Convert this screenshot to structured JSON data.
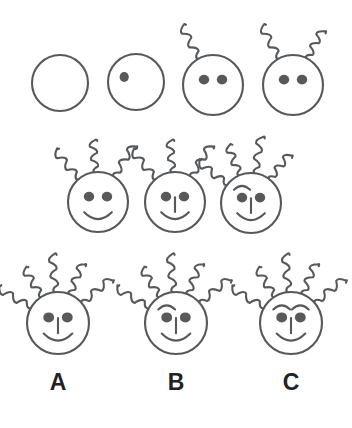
{
  "puzzle": {
    "type": "visual-analogy-matrix",
    "stroke_color": "#55595c",
    "eye_fill_color": "#595959",
    "label_color": "#222222",
    "background_color": "#ffffff",
    "stroke_width": 2.1,
    "sequence_rows": [
      {
        "row_name": "sequence-row-1",
        "figures": [
          {
            "name": "figure-1",
            "cx": 60,
            "cy": 83,
            "r": 28,
            "eyes": 0,
            "antennae": 0,
            "eyebrows": 0,
            "nose": false,
            "mouth": false
          },
          {
            "name": "figure-2",
            "cx": 136,
            "cy": 82,
            "r": 28,
            "eyes": 1,
            "antennae": 0,
            "eyebrows": 0,
            "nose": false,
            "mouth": false
          },
          {
            "name": "figure-3",
            "cx": 213,
            "cy": 85,
            "r": 30,
            "eyes": 2,
            "antennae": 1,
            "eyebrows": 0,
            "nose": false,
            "mouth": false
          },
          {
            "name": "figure-4",
            "cx": 293,
            "cy": 85,
            "r": 30,
            "eyes": 2,
            "antennae": 2,
            "eyebrows": 0,
            "nose": false,
            "mouth": false
          }
        ]
      },
      {
        "row_name": "sequence-row-2",
        "figures": [
          {
            "name": "figure-5",
            "cx": 98,
            "cy": 202,
            "r": 30,
            "eyes": 2,
            "antennae": 3,
            "eyebrows": 0,
            "nose": false,
            "mouth": true
          },
          {
            "name": "figure-6",
            "cx": 175,
            "cy": 202,
            "r": 30,
            "eyes": 2,
            "antennae": 3,
            "eyebrows": 0,
            "nose": true,
            "mouth": true
          },
          {
            "name": "figure-7",
            "cx": 251,
            "cy": 203,
            "r": 30,
            "eyes": 2,
            "antennae": 4,
            "eyebrows": 1,
            "nose": true,
            "mouth": true
          }
        ]
      }
    ],
    "answer_row": {
      "row_name": "answer-options-row",
      "options": [
        {
          "name": "option-a",
          "label": "A",
          "cx": 58,
          "cy": 323,
          "r": 31,
          "label_x": 58,
          "label_y": 390,
          "eyes": 2,
          "antennae": 5,
          "eyebrows": 0,
          "nose": true,
          "mouth": true
        },
        {
          "name": "option-b",
          "label": "B",
          "cx": 176,
          "cy": 323,
          "r": 31,
          "label_x": 176,
          "label_y": 390,
          "eyes": 2,
          "antennae": 5,
          "eyebrows": 1,
          "nose": true,
          "mouth": true
        },
        {
          "name": "option-c",
          "label": "C",
          "cx": 291,
          "cy": 323,
          "r": 31,
          "label_x": 291,
          "label_y": 390,
          "eyes": 2,
          "antennae": 5,
          "eyebrows": 2,
          "nose": true,
          "mouth": true
        }
      ]
    }
  }
}
